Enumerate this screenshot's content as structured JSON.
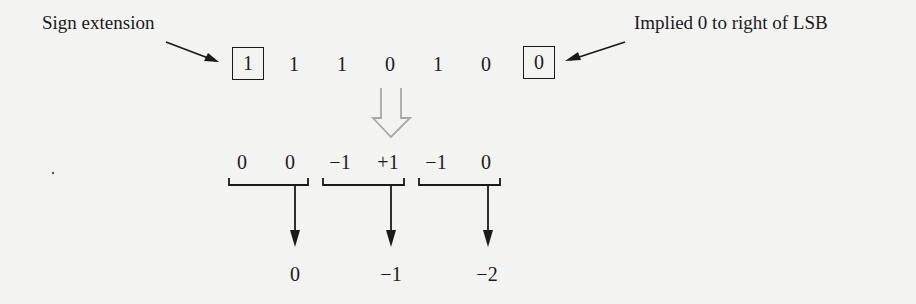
{
  "labels": {
    "sign_extension": "Sign extension",
    "implied_zero": "Implied 0 to right of LSB"
  },
  "bits": {
    "sign_ext": "1",
    "b5": "1",
    "b4": "1",
    "b3": "0",
    "b2": "1",
    "b1": "0",
    "implied": "0"
  },
  "pairs": [
    {
      "left": "0",
      "right": "0",
      "result": "0"
    },
    {
      "left": "−1",
      "right": "+1",
      "result": "−1"
    },
    {
      "left": "−1",
      "right": "0",
      "result": "−2"
    }
  ],
  "colors": {
    "ink": "#1a1a1a",
    "hollow_arrow": "#a8a8a8",
    "background": "#f3f3f2"
  }
}
